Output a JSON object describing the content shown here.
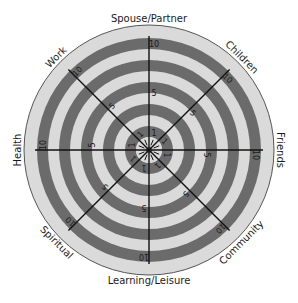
{
  "wheel": {
    "title": "Wheel of Life",
    "center": [
      149,
      150
    ],
    "outer_radius": 125,
    "scale_max": 10,
    "colors": {
      "dark_band": "#6b6b6b",
      "light_band": "#dadada",
      "outline": "#555555",
      "spoke": "#111111",
      "text": "#1a1a1a"
    },
    "segments": [
      {
        "label": "Spouse/Partner",
        "angle": -90,
        "tick_outer": "10",
        "tick_mid": "5",
        "tick_inner": "1"
      },
      {
        "label": "Children",
        "angle": -45,
        "tick_outer": "10",
        "tick_mid": "5",
        "tick_inner": "1"
      },
      {
        "label": "Friends",
        "angle": 0,
        "tick_outer": "10",
        "tick_mid": "5",
        "tick_inner": "1"
      },
      {
        "label": "Community",
        "angle": 45,
        "tick_outer": "10",
        "tick_mid": "5",
        "tick_inner": "1"
      },
      {
        "label": "Learning/Leisure",
        "angle": 90,
        "tick_outer": "10",
        "tick_mid": "5",
        "tick_inner": "1"
      },
      {
        "label": "Spiritual",
        "angle": 135,
        "tick_outer": "10",
        "tick_mid": "5",
        "tick_inner": "1"
      },
      {
        "label": "Health",
        "angle": 180,
        "tick_outer": "10",
        "tick_mid": "5",
        "tick_inner": "1"
      },
      {
        "label": "Work",
        "angle": -135,
        "tick_outer": "10",
        "tick_mid": "5",
        "tick_inner": "1"
      }
    ]
  }
}
